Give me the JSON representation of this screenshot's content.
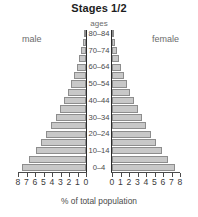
{
  "chart_data": {
    "type": "bar",
    "title": "Stages 1/2",
    "subtype": "population-pyramid",
    "xlabel": "% of total population",
    "ylabel": "ages",
    "left_series_label": "male",
    "right_series_label": "female",
    "xlim": [
      0,
      8.5
    ],
    "grid": false,
    "legend_position": "inline-top-left-right",
    "categories": [
      "0–4",
      "5–9",
      "10–14",
      "15–19",
      "20–24",
      "25–29",
      "30–34",
      "35–39",
      "40–44",
      "45–49",
      "50–54",
      "55–59",
      "60–64",
      "65–69",
      "70–74",
      "75–79",
      "80–84"
    ],
    "visible_category_labels": [
      "0–4",
      "10–14",
      "20–24",
      "30–34",
      "40–44",
      "50–54",
      "60–64",
      "70–74",
      "80–84"
    ],
    "series": [
      {
        "name": "male",
        "side": "left",
        "values": [
          8.0,
          7.1,
          6.3,
          5.6,
          5.0,
          4.4,
          3.8,
          3.3,
          2.8,
          2.3,
          1.9,
          1.5,
          1.15,
          0.85,
          0.6,
          0.4,
          0.25
        ]
      },
      {
        "name": "female",
        "side": "right",
        "values": [
          7.9,
          7.0,
          6.2,
          5.5,
          4.9,
          4.3,
          3.7,
          3.2,
          2.7,
          2.25,
          1.85,
          1.5,
          1.15,
          0.85,
          0.6,
          0.4,
          0.25
        ]
      }
    ],
    "left_tick_labels": [
      "8",
      "7",
      "6",
      "5",
      "4",
      "3",
      "2",
      "1",
      "0"
    ],
    "right_tick_labels": [
      "0",
      "1",
      "2",
      "3",
      "4",
      "5",
      "6",
      "7",
      "8"
    ],
    "colors": {
      "bar_fill": "#c8c8c8",
      "bar_stroke": "#8d8d8d",
      "axis": "#2b2b2b",
      "title_text": "#1d1d1d",
      "label_text": "#4a4a4a",
      "side_label_text": "#6b6b6b",
      "background": "#ffffff"
    }
  }
}
